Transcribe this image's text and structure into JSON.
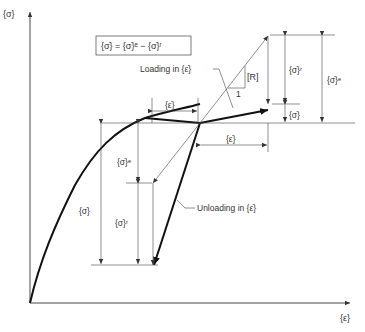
{
  "axes": {
    "y_label": "{σ}",
    "x_label": "{ε}"
  },
  "equation_box": {
    "text": "{σ̇} = {σ̇}ᵉ − {σ̇}ʳ"
  },
  "annotations": {
    "loading": "Loading in {ε̇}",
    "unloading": "Unloading in {ε̇}",
    "r_matrix": "[R]",
    "slope_one": "1"
  },
  "dimensions": {
    "eps_dot_top": "{ε̇}",
    "eps_dot_right": "{ε̇}",
    "sigma_dot_r_right": "{σ̇}ʳ",
    "sigma_dot_e_right": "{σ̇}ᵉ",
    "sigma_dot_right": "{σ̇}",
    "sigma_dot_left": "{σ̇}",
    "sigma_dot_e_left": "{σ̇}ᵉ",
    "sigma_dot_r_left": "{σ̇}ʳ"
  },
  "colors": {
    "line": "#111111",
    "thin": "#444444",
    "background": "#ffffff"
  }
}
